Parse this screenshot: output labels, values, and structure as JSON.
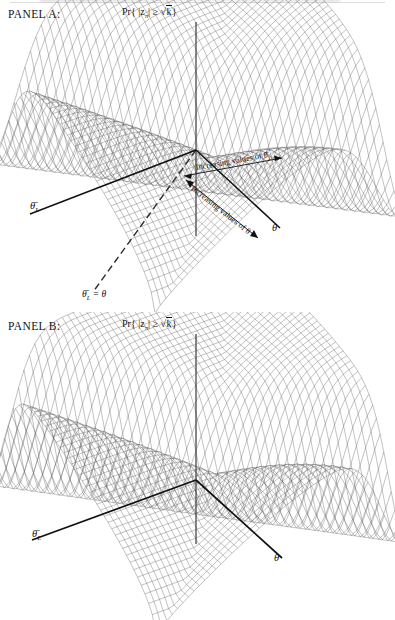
{
  "figure": {
    "type": "two-panel-3d-surface-mesh",
    "background": "#ffffff",
    "mesh_color": "#3a3a3a",
    "axis_color": "#111111"
  },
  "panels": [
    {
      "id": "panel-a",
      "label": "PANEL A:",
      "vertical_axis_label": "Pr{|zπ| ≥ √k}",
      "vertical_axis_label_parts": {
        "prefix": "Pr{ |z",
        "sub": "π",
        "mid": "| ≥ ",
        "radical": "√",
        "radicand": "k",
        "suffix": "}"
      },
      "axes": [
        {
          "name": "theta-bar-L",
          "label": "θ̄",
          "sub": "L",
          "position": "left-front"
        },
        {
          "name": "theta",
          "label": "θ",
          "sub": "",
          "position": "right-front"
        },
        {
          "name": "probability",
          "label": "Pr{|zπ| ≥ √k}",
          "sub": "",
          "position": "vertical"
        }
      ],
      "annotations": [
        {
          "name": "increasing-theta-bar-L",
          "text": "Increasing values of θ̄",
          "sub": "L",
          "rotation_deg": -10
        },
        {
          "name": "increasing-theta",
          "text": "Increasing values of θ",
          "sub": "",
          "rotation_deg": 38
        }
      ],
      "diagonal_line_label": {
        "text": "θ̄",
        "sub": "L",
        "equals": " = θ",
        "dashed": true
      }
    },
    {
      "id": "panel-b",
      "label": "PANEL B:",
      "vertical_axis_label": "Pr{|zπ| ≥ √k}",
      "vertical_axis_label_parts": {
        "prefix": "Pr{ |z",
        "sub": "π",
        "mid": "| ≥ ",
        "radical": "√",
        "radicand": "k",
        "suffix": "}"
      },
      "axes": [
        {
          "name": "theta-bar-L",
          "label": "θ̄",
          "sub": "L",
          "position": "left-front"
        },
        {
          "name": "theta",
          "label": "θ",
          "sub": "",
          "position": "right-front"
        },
        {
          "name": "probability",
          "label": "Pr{|zπ| ≥ √k}",
          "sub": "",
          "position": "vertical"
        }
      ],
      "annotations": [],
      "diagonal_line_label": null
    }
  ],
  "chart_data": {
    "type": "surface",
    "title": "",
    "subtitle": "",
    "xlabel": "θ̄L",
    "ylabel": "θ",
    "zlabel": "Pr{|zπ| ≥ √k}",
    "grid": false,
    "legend": "none",
    "xlim": [
      0,
      1
    ],
    "ylim": [
      0,
      1
    ],
    "zlim": [
      0,
      1
    ],
    "surfaces": [
      {
        "panel": "A",
        "name": "rejection-probability-surface-A",
        "description": "Saddle-like mesh surface with a high plateau on the left, a deep valley trough running along the diagonal theta-bar-L = theta, and a sharp ridge rising on the right.",
        "mesh_lines_u": 46,
        "mesh_lines_v": 46,
        "valley_along": "θ̄L = θ",
        "peak_z": 1.0,
        "trough_z": 0.05,
        "plateau_left_z": 0.86,
        "ridge_right_z": 1.0
      },
      {
        "panel": "B",
        "name": "rejection-probability-surface-B",
        "description": "Similar saddle mesh surface with left plateau and right ridge separated by a narrow valley; no diagonal reference line drawn.",
        "mesh_lines_u": 46,
        "mesh_lines_v": 46,
        "valley_along": "θ̄L = θ",
        "peak_z": 1.0,
        "trough_z": 0.08,
        "plateau_left_z": 0.84,
        "ridge_right_z": 1.0
      }
    ]
  }
}
